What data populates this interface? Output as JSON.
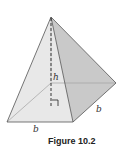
{
  "figure": {
    "caption": "Figure 10.2",
    "labels": {
      "height": "h",
      "base_bottom": "b",
      "base_right": "b"
    },
    "colors": {
      "left_face": "#efefef",
      "front_face": "#e6e6e6",
      "right_face": "#c8c8c8",
      "edge": "#555555",
      "hidden_edge": "#9a9a9a",
      "height_line": "#222222"
    },
    "shape": "square-pyramid",
    "right_angle_marker": true
  }
}
